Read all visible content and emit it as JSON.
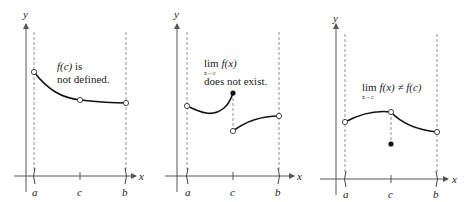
{
  "figure": {
    "panels": [
      {
        "id": "not-defined",
        "axis_labels": {
          "x": "x",
          "y": "y"
        },
        "tick_labels": {
          "a": "a",
          "c": "c",
          "b": "b"
        },
        "annotation": {
          "line1": "f(c) is",
          "line1_fn": "f(c)",
          "line1_rest": " is",
          "line2": "not defined."
        }
      },
      {
        "id": "limit-dne",
        "axis_labels": {
          "x": "x",
          "y": "y"
        },
        "tick_labels": {
          "a": "a",
          "c": "c",
          "b": "b"
        },
        "annotation": {
          "lim": "lim",
          "fn": "f(x)",
          "sub": "x→c",
          "line2": "does not exist."
        }
      },
      {
        "id": "limit-not-equal",
        "axis_labels": {
          "x": "x",
          "y": "y"
        },
        "tick_labels": {
          "a": "a",
          "c": "c",
          "b": "b"
        },
        "annotation": {
          "lim": "lim",
          "fn": "f(x)",
          "neq": "≠",
          "fc": "f(c)",
          "sub": "x→c"
        }
      }
    ]
  }
}
